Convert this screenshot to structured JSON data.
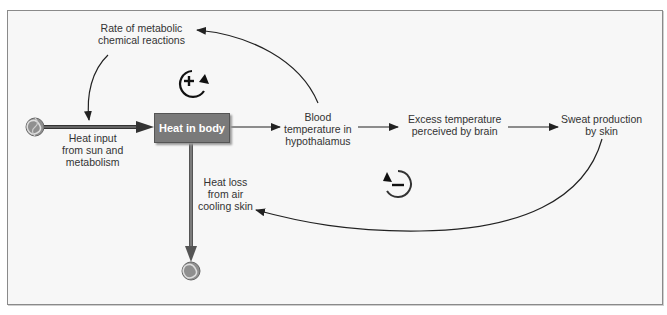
{
  "diagram": {
    "stock": {
      "label": "Heat in body"
    },
    "labels": {
      "rate_metabolic": [
        "Rate of metabolic",
        "chemical reactions"
      ],
      "heat_input": [
        "Heat input",
        "from sun and",
        "metabolism"
      ],
      "blood_temp": [
        "Blood",
        "temperature in",
        "hypothalamus"
      ],
      "excess_temp": [
        "Excess temperature",
        "perceived by brain"
      ],
      "sweat": [
        "Sweat production",
        "by skin"
      ],
      "heat_loss": [
        "Heat loss",
        "from air",
        "cooling skin"
      ]
    },
    "loops": {
      "reinforcing": {
        "symbol": "+",
        "type": "positive feedback loop"
      },
      "balancing": {
        "symbol": "−",
        "type": "negative feedback loop"
      }
    },
    "colors": {
      "stock_fill": "#7a7a7a",
      "flow_pipe": "#555555",
      "arrow": "#222222",
      "background": "#f7f7f7",
      "cloud": "#9a9a9a"
    }
  }
}
